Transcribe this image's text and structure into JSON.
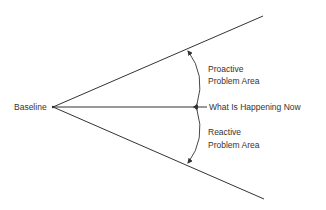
{
  "diagram": {
    "baseline_label": "Baseline",
    "now_label": "What Is Happening Now",
    "proactive": {
      "line1": "Proactive",
      "line2": "Problem Area"
    },
    "reactive": {
      "line1": "Reactive",
      "line2": "Problem Area"
    },
    "line_color": "#333333"
  }
}
